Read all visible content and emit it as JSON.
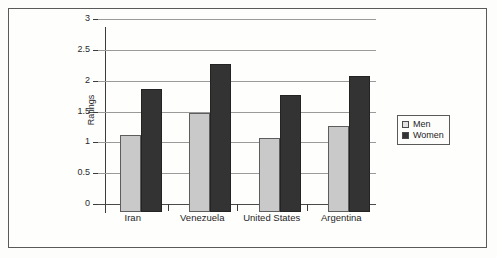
{
  "chart_data": {
    "type": "bar",
    "title": "",
    "xlabel": "",
    "ylabel": "Ratings",
    "ylim": [
      0,
      3
    ],
    "ytick_labels": [
      "3",
      "2.5",
      "2",
      "1.5",
      "1",
      "0.5",
      "0"
    ],
    "ytick_values": [
      3,
      2.5,
      2,
      1.5,
      1,
      0.5,
      0
    ],
    "grid": true,
    "legend_position": "right",
    "categories": [
      "Iran",
      "Venezuela",
      "United States",
      "Argentina"
    ],
    "series": [
      {
        "name": "Men",
        "color": "#c9c9c9",
        "values": [
          1.25,
          1.6,
          1.2,
          1.4
        ]
      },
      {
        "name": "Women",
        "color": "#333333",
        "values": [
          2.0,
          2.4,
          1.9,
          2.2
        ]
      }
    ]
  },
  "legend": {
    "items": [
      {
        "label": "Men",
        "swatch": "legend-swatch-men"
      },
      {
        "label": "Women",
        "swatch": "legend-swatch-women"
      }
    ]
  },
  "colors": {
    "men_bar": "#c9c9c9",
    "women_bar": "#333333",
    "gridline": "#9a9a9a",
    "axis": "#3c3c3c",
    "frame": "#5a5a5a",
    "background": "#fdfdfc"
  }
}
